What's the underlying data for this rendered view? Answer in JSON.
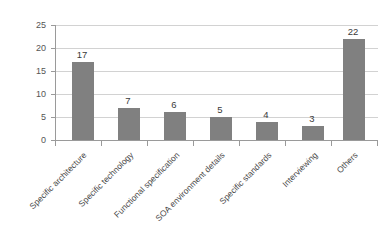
{
  "chart_data": {
    "type": "bar",
    "title": "",
    "subtitle": "",
    "xlabel": "",
    "ylabel": "",
    "ylim": [
      0,
      25
    ],
    "yticks": [
      0,
      5,
      10,
      15,
      20,
      25
    ],
    "grid": true,
    "legend": false,
    "legend_position": "none",
    "orientation": "vertical",
    "categories": [
      "Specific architecture",
      "Specific technology",
      "Functional specification",
      "SOA environment details",
      "Specific standards",
      "Interviewing",
      "Others"
    ],
    "values": [
      17,
      7,
      6,
      5,
      4,
      3,
      22
    ],
    "data_labels": [
      "17",
      "7",
      "6",
      "5",
      "4",
      "3",
      "22"
    ],
    "series": [
      {
        "name": "",
        "values": [
          17,
          7,
          6,
          5,
          4,
          3,
          22
        ]
      }
    ]
  },
  "axes": {
    "y_tick_labels": [
      "25",
      "20",
      "15",
      "10",
      "5",
      "0"
    ],
    "x_tick_labels": [
      "Specific architecture",
      "Specific technology",
      "Functional specification",
      "SOA environment details",
      "Specific standards",
      "Interviewing",
      "Others"
    ]
  },
  "colors": {
    "bar": "#808080",
    "gridline": "#d2d2d2",
    "axis": "#9a9a9a",
    "background": "#ffffff",
    "label_text": "#4a4a4a",
    "value_text": "#3a3a3a"
  }
}
